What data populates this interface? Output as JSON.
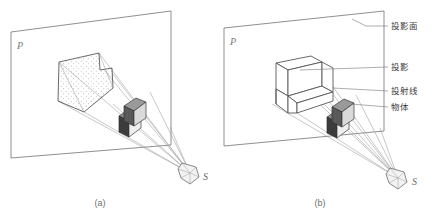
{
  "figure": {
    "background": "#ffffff",
    "ink": "#4a4a4a",
    "panels": [
      {
        "id": "a",
        "caption": "(a)",
        "plane_label": "P",
        "source_label": "S",
        "projection_style": "stippled-silhouette",
        "description": "中心投影 — 影子为带点状填充的实影轮廓"
      },
      {
        "id": "b",
        "caption": "(b)",
        "plane_label": "P",
        "source_label": "S",
        "projection_style": "wireframe-outline",
        "description": "中心投影 — 投影为线框轮廓的立体图"
      }
    ],
    "callouts": [
      {
        "key": "plane",
        "label": "投影面"
      },
      {
        "key": "shadow",
        "label": "投影"
      },
      {
        "key": "rays",
        "label": "投射线"
      },
      {
        "key": "object",
        "label": "物体"
      }
    ],
    "colors": {
      "line": "#5a5a5a",
      "ray": "#8e8e8e",
      "stipple": "#7b7b7b",
      "object_dark": "#3c3c3c",
      "object_mid": "#8d8d8d",
      "object_light": "#efefef",
      "caption": "#6f6f6f"
    }
  }
}
